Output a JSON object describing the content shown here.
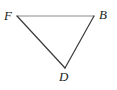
{
  "figure": {
    "kind": "geometry-diagram",
    "shape": "triangle",
    "background_color": "#ffffff",
    "width": 117,
    "height": 90,
    "vertices": [
      {
        "id": "F",
        "label": "F",
        "x": 17,
        "y": 16,
        "label_x": 4,
        "label_y": 9,
        "label_position": "left"
      },
      {
        "id": "B",
        "label": "B",
        "x": 94,
        "y": 16,
        "label_x": 99,
        "label_y": 8,
        "label_position": "right"
      },
      {
        "id": "D",
        "label": "D",
        "x": 65,
        "y": 68,
        "label_x": 59,
        "label_y": 70,
        "label_position": "below"
      }
    ],
    "edges": [
      {
        "id": "FB",
        "from": "F",
        "to": "B",
        "color": "#8a8a8a",
        "width": 1.2
      },
      {
        "id": "BD",
        "from": "B",
        "to": "D",
        "color": "#3a3a3a",
        "width": 1.2
      },
      {
        "id": "DF",
        "from": "D",
        "to": "F",
        "color": "#3a3a3a",
        "width": 1.2
      }
    ],
    "label_color": "#231f20",
    "label_font_size": 13
  }
}
